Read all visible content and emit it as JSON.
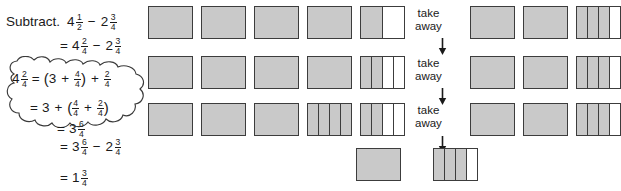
{
  "worked_example": {
    "prompt_label": "Subtract.",
    "lines": [
      {
        "id": "line1",
        "parts": [
          {
            "type": "text",
            "value": "Subtract."
          },
          {
            "type": "mixed",
            "whole": "4",
            "num": "1",
            "den": "2"
          },
          {
            "type": "op",
            "value": "−"
          },
          {
            "type": "mixed",
            "whole": "2",
            "num": "3",
            "den": "4"
          }
        ],
        "plain": "Subtract. 4 1/2 − 2 3/4"
      },
      {
        "id": "line2",
        "parts": [
          {
            "type": "eq",
            "value": "="
          },
          {
            "type": "mixed",
            "whole": "4",
            "num": "2",
            "den": "4"
          },
          {
            "type": "op",
            "value": "−"
          },
          {
            "type": "mixed",
            "whole": "2",
            "num": "3",
            "den": "4"
          }
        ],
        "plain": "= 4 2/4 − 2 3/4"
      },
      {
        "id": "line5",
        "parts": [
          {
            "type": "eq",
            "value": "="
          },
          {
            "type": "mixed",
            "whole": "3",
            "num": "6",
            "den": "4"
          },
          {
            "type": "op",
            "value": "−"
          },
          {
            "type": "mixed",
            "whole": "2",
            "num": "3",
            "den": "4"
          }
        ],
        "plain": "= 3 6/4 − 2 3/4"
      },
      {
        "id": "line6",
        "parts": [
          {
            "type": "eq",
            "value": "="
          },
          {
            "type": "mixed",
            "whole": "1",
            "num": "3",
            "den": "4"
          }
        ],
        "plain": "= 1 3/4"
      }
    ]
  },
  "cloud": {
    "line1": {
      "plain": "4 2/4 = (3 + 4/4) + 2/4",
      "mixed_whole": "4",
      "mixed_num": "2",
      "mixed_den": "4",
      "equals": "=",
      "open_paren": "(",
      "three": "3",
      "plus1": "+",
      "frac1_num": "4",
      "frac1_den": "4",
      "close_paren": ")",
      "plus2": "+",
      "frac2_num": "2",
      "frac2_den": "4"
    },
    "line2": {
      "plain": "= 3 + (4/4 + 2/4)",
      "equals": "=",
      "three": "3",
      "plus1": "+",
      "open_paren": "(",
      "frac1_num": "4",
      "frac1_den": "4",
      "plus2": "+",
      "frac2_num": "2",
      "frac2_den": "4",
      "close_paren": ")"
    },
    "line3": {
      "plain": "= 3 6/4",
      "equals": "=",
      "mixed_whole": "3",
      "mixed_num": "6",
      "mixed_den": "4"
    }
  },
  "diagram": {
    "take_away_label_line1": "take",
    "take_away_label_line2": "away",
    "fill_color": "#c9c9c9",
    "stroke_color": "#3c3c3c",
    "rows": [
      {
        "id": "row-1",
        "left_group": [
          {
            "parts": 1,
            "shaded": 1
          },
          {
            "parts": 1,
            "shaded": 1
          },
          {
            "parts": 1,
            "shaded": 1
          },
          {
            "parts": 1,
            "shaded": 1
          },
          {
            "parts": 2,
            "shaded": 1
          }
        ],
        "right_group": [
          {
            "parts": 1,
            "shaded": 1
          },
          {
            "parts": 1,
            "shaded": 1
          },
          {
            "parts": 4,
            "shaded": 3
          }
        ],
        "value_left": "4 2/4",
        "value_right": "2 3/4"
      },
      {
        "id": "row-2",
        "left_group": [
          {
            "parts": 1,
            "shaded": 1
          },
          {
            "parts": 1,
            "shaded": 1
          },
          {
            "parts": 1,
            "shaded": 1
          },
          {
            "parts": 1,
            "shaded": 1
          },
          {
            "parts": 4,
            "shaded": 2
          }
        ],
        "right_group": [
          {
            "parts": 1,
            "shaded": 1
          },
          {
            "parts": 1,
            "shaded": 1
          },
          {
            "parts": 4,
            "shaded": 3
          }
        ],
        "value_left": "4 2/4",
        "value_right": "2 3/4"
      },
      {
        "id": "row-3",
        "left_group": [
          {
            "parts": 1,
            "shaded": 1
          },
          {
            "parts": 1,
            "shaded": 1
          },
          {
            "parts": 1,
            "shaded": 1
          },
          {
            "parts": 4,
            "shaded": 4
          },
          {
            "parts": 4,
            "shaded": 2
          }
        ],
        "right_group": [
          {
            "parts": 1,
            "shaded": 1
          },
          {
            "parts": 1,
            "shaded": 1
          },
          {
            "parts": 4,
            "shaded": 3
          }
        ],
        "value_left": "3 6/4",
        "value_right": "2 3/4"
      },
      {
        "id": "row-4",
        "left_group": [
          {
            "parts": 1,
            "shaded": 1
          },
          {
            "parts": 4,
            "shaded": 3
          }
        ],
        "right_group": [],
        "value_left": "1 3/4",
        "value_right": ""
      }
    ]
  }
}
